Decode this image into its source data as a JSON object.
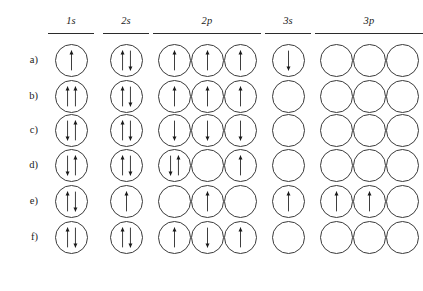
{
  "figure": {
    "subshell_headers": [
      {
        "label": "1s",
        "boxes": 1
      },
      {
        "label": "2s",
        "boxes": 1
      },
      {
        "label": "2p",
        "boxes": 3
      },
      {
        "label": "3s",
        "boxes": 1
      },
      {
        "label": "3p",
        "boxes": 3
      }
    ],
    "row_labels": [
      "a)",
      "b)",
      "c)",
      "d)",
      "e)",
      "f)"
    ],
    "colors": {
      "ink": "#1a1a1a",
      "circle_stroke": "#3a3a3a",
      "rule": "#2b2b2b",
      "background": "#ffffff"
    },
    "rows": [
      {
        "label": "a)",
        "subshells": [
          {
            "name": "1s",
            "orbitals": [
              [
                "up"
              ]
            ]
          },
          {
            "name": "2s",
            "orbitals": [
              [
                "up",
                "down"
              ]
            ]
          },
          {
            "name": "2p",
            "orbitals": [
              [
                "up"
              ],
              [
                "up"
              ],
              [
                "up"
              ]
            ]
          },
          {
            "name": "3s",
            "orbitals": [
              [
                "down"
              ]
            ]
          },
          {
            "name": "3p",
            "orbitals": [
              [],
              [],
              []
            ]
          }
        ]
      },
      {
        "label": "b)",
        "subshells": [
          {
            "name": "1s",
            "orbitals": [
              [
                "up",
                "up"
              ]
            ]
          },
          {
            "name": "2s",
            "orbitals": [
              [
                "up",
                "down"
              ]
            ]
          },
          {
            "name": "2p",
            "orbitals": [
              [
                "up"
              ],
              [
                "up"
              ],
              [
                "up"
              ]
            ]
          },
          {
            "name": "3s",
            "orbitals": [
              []
            ]
          },
          {
            "name": "3p",
            "orbitals": [
              [],
              [],
              []
            ]
          }
        ]
      },
      {
        "label": "c)",
        "subshells": [
          {
            "name": "1s",
            "orbitals": [
              [
                "down",
                "up"
              ]
            ]
          },
          {
            "name": "2s",
            "orbitals": [
              [
                "up",
                "down"
              ]
            ]
          },
          {
            "name": "2p",
            "orbitals": [
              [
                "down"
              ],
              [
                "down"
              ],
              [
                "down"
              ]
            ]
          },
          {
            "name": "3s",
            "orbitals": [
              []
            ]
          },
          {
            "name": "3p",
            "orbitals": [
              [],
              [],
              []
            ]
          }
        ]
      },
      {
        "label": "d)",
        "subshells": [
          {
            "name": "1s",
            "orbitals": [
              [
                "down",
                "up"
              ]
            ]
          },
          {
            "name": "2s",
            "orbitals": [
              [
                "up",
                "down"
              ]
            ]
          },
          {
            "name": "2p",
            "orbitals": [
              [
                "down",
                "up"
              ],
              [],
              [
                "up"
              ]
            ]
          },
          {
            "name": "3s",
            "orbitals": [
              []
            ]
          },
          {
            "name": "3p",
            "orbitals": [
              [],
              [],
              []
            ]
          }
        ]
      },
      {
        "label": "e)",
        "subshells": [
          {
            "name": "1s",
            "orbitals": [
              [
                "up",
                "down"
              ]
            ]
          },
          {
            "name": "2s",
            "orbitals": [
              [
                "up"
              ]
            ]
          },
          {
            "name": "2p",
            "orbitals": [
              [],
              [
                "up"
              ],
              []
            ]
          },
          {
            "name": "3s",
            "orbitals": [
              [
                "up"
              ]
            ]
          },
          {
            "name": "3p",
            "orbitals": [
              [
                "up"
              ],
              [
                "up"
              ],
              []
            ]
          }
        ]
      },
      {
        "label": "f)",
        "subshells": [
          {
            "name": "1s",
            "orbitals": [
              [
                "up",
                "down"
              ]
            ]
          },
          {
            "name": "2s",
            "orbitals": [
              [
                "up",
                "down"
              ]
            ]
          },
          {
            "name": "2p",
            "orbitals": [
              [
                "up"
              ],
              [
                "down"
              ],
              [
                "up"
              ]
            ]
          },
          {
            "name": "3s",
            "orbitals": [
              []
            ]
          },
          {
            "name": "3p",
            "orbitals": [
              [],
              [],
              []
            ]
          }
        ]
      }
    ]
  },
  "layout": {
    "circle_diameter": 33,
    "row_tops": [
      44,
      80,
      114,
      149,
      185,
      221
    ],
    "group_x": [
      48,
      103,
      153,
      265,
      315
    ],
    "group_widths": [
      46,
      46,
      108,
      46,
      108
    ]
  }
}
